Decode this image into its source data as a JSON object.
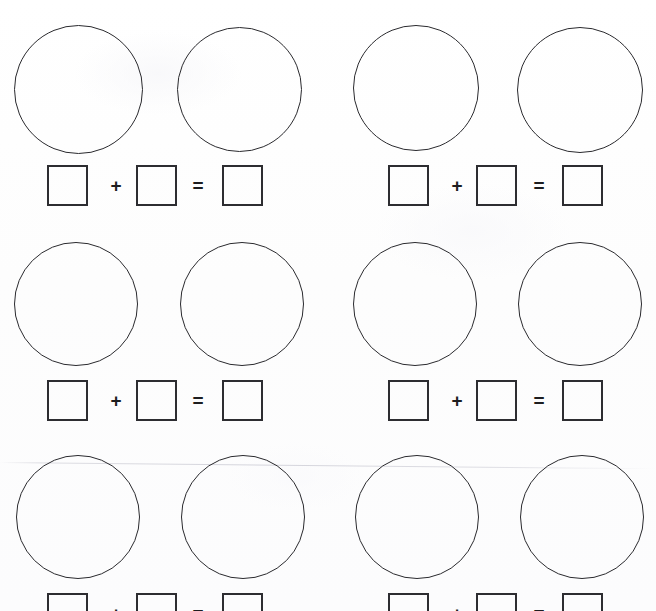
{
  "worksheet": {
    "title": "Addition Worksheet with Ten Frames Circles",
    "page_width": 656,
    "page_height": 611,
    "background_color": "#fdfdfd",
    "ink_color": "#2a2a2e",
    "box_ink_color": "#2d2d31",
    "scan_artifact": {
      "present": true,
      "label": "faint-horizontal-scan-line",
      "y": 462,
      "tilt_deg": 0.55,
      "color": "#d8d8de"
    }
  },
  "layout": {
    "columns": 2,
    "rows": 3,
    "column_offset_px": 340,
    "row_pitch_px": 214,
    "circle_diameter_px": 126,
    "box_size_px": 41,
    "last_row_clipped": true
  },
  "symbols": {
    "plus": "+",
    "equals": "=",
    "blank_value": ""
  },
  "problems": [
    {
      "id": "problem-1",
      "position": "row-1-left",
      "col": 0,
      "row": 0,
      "circles": [
        {
          "id": "p1-circle-a",
          "label": "addend-1-circle",
          "value": "",
          "x": 14,
          "y": 25,
          "d": 129
        },
        {
          "id": "p1-circle-b",
          "label": "addend-2-circle",
          "value": "",
          "x": 177,
          "y": 27,
          "d": 125
        }
      ],
      "equation": {
        "addend_1": "",
        "addend_2": "",
        "sum": "",
        "boxes": [
          {
            "id": "p1-box-addend-1",
            "x": 47,
            "y": 165
          },
          {
            "id": "p1-box-addend-2",
            "x": 136,
            "y": 165
          },
          {
            "id": "p1-box-sum",
            "x": 222,
            "y": 165
          }
        ],
        "plus": {
          "x": 106,
          "y": 176
        },
        "equals": {
          "x": 188,
          "y": 176
        }
      }
    },
    {
      "id": "problem-2",
      "position": "row-1-right",
      "col": 1,
      "row": 0,
      "circles": [
        {
          "id": "p2-circle-a",
          "label": "addend-1-circle",
          "value": "",
          "x": 353,
          "y": 25,
          "d": 126
        },
        {
          "id": "p2-circle-b",
          "label": "addend-2-circle",
          "value": "",
          "x": 517,
          "y": 27,
          "d": 126
        }
      ],
      "equation": {
        "addend_1": "",
        "addend_2": "",
        "sum": "",
        "boxes": [
          {
            "id": "p2-box-addend-1",
            "x": 388,
            "y": 165
          },
          {
            "id": "p2-box-addend-2",
            "x": 476,
            "y": 165
          },
          {
            "id": "p2-box-sum",
            "x": 562,
            "y": 165
          }
        ],
        "plus": {
          "x": 447,
          "y": 176
        },
        "equals": {
          "x": 529,
          "y": 176
        }
      }
    },
    {
      "id": "problem-3",
      "position": "row-2-left",
      "col": 0,
      "row": 1,
      "circles": [
        {
          "id": "p3-circle-a",
          "label": "addend-1-circle",
          "value": "",
          "x": 14,
          "y": 242,
          "d": 124
        },
        {
          "id": "p3-circle-b",
          "label": "addend-2-circle",
          "value": "",
          "x": 180,
          "y": 242,
          "d": 124
        }
      ],
      "equation": {
        "addend_1": "",
        "addend_2": "",
        "sum": "",
        "boxes": [
          {
            "id": "p3-box-addend-1",
            "x": 47,
            "y": 380
          },
          {
            "id": "p3-box-addend-2",
            "x": 136,
            "y": 380
          },
          {
            "id": "p3-box-sum",
            "x": 222,
            "y": 380
          }
        ],
        "plus": {
          "x": 106,
          "y": 391
        },
        "equals": {
          "x": 188,
          "y": 391
        }
      }
    },
    {
      "id": "problem-4",
      "position": "row-2-right",
      "col": 1,
      "row": 1,
      "circles": [
        {
          "id": "p4-circle-a",
          "label": "addend-1-circle",
          "value": "",
          "x": 353,
          "y": 242,
          "d": 124
        },
        {
          "id": "p4-circle-b",
          "label": "addend-2-circle",
          "value": "",
          "x": 518,
          "y": 242,
          "d": 124
        }
      ],
      "equation": {
        "addend_1": "",
        "addend_2": "",
        "sum": "",
        "boxes": [
          {
            "id": "p4-box-addend-1",
            "x": 388,
            "y": 380
          },
          {
            "id": "p4-box-addend-2",
            "x": 476,
            "y": 380
          },
          {
            "id": "p4-box-sum",
            "x": 562,
            "y": 380
          }
        ],
        "plus": {
          "x": 447,
          "y": 391
        },
        "equals": {
          "x": 529,
          "y": 391
        }
      }
    },
    {
      "id": "problem-5",
      "position": "row-3-left",
      "col": 0,
      "row": 2,
      "circles": [
        {
          "id": "p5-circle-a",
          "label": "addend-1-circle",
          "value": "",
          "x": 16,
          "y": 455,
          "d": 124
        },
        {
          "id": "p5-circle-b",
          "label": "addend-2-circle",
          "value": "",
          "x": 181,
          "y": 455,
          "d": 124
        }
      ],
      "equation": {
        "addend_1": "",
        "addend_2": "",
        "sum": "",
        "boxes": [
          {
            "id": "p5-box-addend-1",
            "x": 47,
            "y": 593
          },
          {
            "id": "p5-box-addend-2",
            "x": 136,
            "y": 593
          },
          {
            "id": "p5-box-sum",
            "x": 222,
            "y": 593
          }
        ],
        "plus": {
          "x": 106,
          "y": 604
        },
        "equals": {
          "x": 188,
          "y": 604
        }
      }
    },
    {
      "id": "problem-6",
      "position": "row-3-right",
      "col": 1,
      "row": 2,
      "circles": [
        {
          "id": "p6-circle-a",
          "label": "addend-1-circle",
          "value": "",
          "x": 355,
          "y": 455,
          "d": 124
        },
        {
          "id": "p6-circle-b",
          "label": "addend-2-circle",
          "value": "",
          "x": 520,
          "y": 455,
          "d": 124
        }
      ],
      "equation": {
        "addend_1": "",
        "addend_2": "",
        "sum": "",
        "boxes": [
          {
            "id": "p6-box-addend-1",
            "x": 388,
            "y": 593
          },
          {
            "id": "p6-box-addend-2",
            "x": 476,
            "y": 593
          },
          {
            "id": "p6-box-sum",
            "x": 562,
            "y": 593
          }
        ],
        "plus": {
          "x": 447,
          "y": 604
        },
        "equals": {
          "x": 529,
          "y": 604
        }
      }
    }
  ]
}
